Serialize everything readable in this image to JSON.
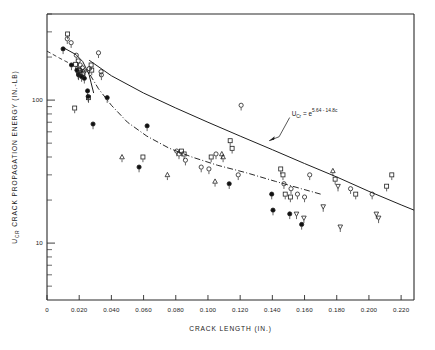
{
  "figure": {
    "background": "#ffffff",
    "ink": "#1f1f1f"
  },
  "chart_data": {
    "type": "scatter",
    "title": "",
    "xlabel": "CRACK  LENGTH (IN.)",
    "ylabel": "U    CRACK  PROPAGATION  ENERGY  (IN.-LB)",
    "ylabel_sub": "CR",
    "xlim": [
      0,
      0.228
    ],
    "ylim": [
      4.0,
      400
    ],
    "yscale": "log",
    "xscale": "linear",
    "grid": false,
    "legend": null,
    "xticks": [
      0,
      0.02,
      0.04,
      0.06,
      0.08,
      0.1,
      0.12,
      0.14,
      0.16,
      0.18,
      0.2,
      0.22
    ],
    "xticklabels": [
      "0",
      "0.020",
      "0.040",
      "0.060",
      "0.080",
      "0.100",
      "0.120",
      "0.140",
      "0.160",
      "0.180",
      "0.200",
      "0.220"
    ],
    "yticks": [
      100,
      10
    ],
    "yticklabels": [
      "100",
      "10"
    ],
    "yminorticks": [
      400,
      300,
      200,
      90,
      80,
      70,
      60,
      50,
      40,
      30,
      20,
      9,
      8,
      7,
      6,
      5
    ],
    "annotations": [
      {
        "name": "regression-equation",
        "text_main": "U",
        "text_sub": "Cr",
        "text_eq": " = e",
        "text_sup": "5.64 - 14.8c",
        "x": 0.152,
        "y": 78,
        "leader_to_x": 0.138,
        "leader_to_y": 52
      }
    ],
    "series": [
      {
        "name": "filled-circle",
        "marker": "filled-circle",
        "points": [
          {
            "x": 0.01,
            "y": 228
          },
          {
            "x": 0.0152,
            "y": 176
          },
          {
            "x": 0.0186,
            "y": 162
          },
          {
            "x": 0.0196,
            "y": 150
          },
          {
            "x": 0.0215,
            "y": 146
          },
          {
            "x": 0.0232,
            "y": 142
          },
          {
            "x": 0.0252,
            "y": 116
          },
          {
            "x": 0.0256,
            "y": 106
          },
          {
            "x": 0.0374,
            "y": 104
          },
          {
            "x": 0.0286,
            "y": 68
          },
          {
            "x": 0.0572,
            "y": 34
          },
          {
            "x": 0.0622,
            "y": 66
          },
          {
            "x": 0.1132,
            "y": 26
          },
          {
            "x": 0.1396,
            "y": 22
          },
          {
            "x": 0.1404,
            "y": 17
          },
          {
            "x": 0.1508,
            "y": 16
          },
          {
            "x": 0.1582,
            "y": 13.5
          }
        ]
      },
      {
        "name": "open-circle",
        "marker": "open-circle",
        "points": [
          {
            "x": 0.0126,
            "y": 268
          },
          {
            "x": 0.015,
            "y": 252
          },
          {
            "x": 0.0182,
            "y": 206
          },
          {
            "x": 0.0194,
            "y": 188
          },
          {
            "x": 0.0206,
            "y": 176
          },
          {
            "x": 0.022,
            "y": 168
          },
          {
            "x": 0.0232,
            "y": 160
          },
          {
            "x": 0.0262,
            "y": 166
          },
          {
            "x": 0.032,
            "y": 214
          },
          {
            "x": 0.0336,
            "y": 158
          },
          {
            "x": 0.0338,
            "y": 150
          },
          {
            "x": 0.1206,
            "y": 92
          },
          {
            "x": 0.0806,
            "y": 44
          },
          {
            "x": 0.082,
            "y": 42
          },
          {
            "x": 0.086,
            "y": 38
          },
          {
            "x": 0.0958,
            "y": 34
          },
          {
            "x": 0.1006,
            "y": 33
          },
          {
            "x": 0.105,
            "y": 42
          },
          {
            "x": 0.1188,
            "y": 30
          },
          {
            "x": 0.1472,
            "y": 26
          },
          {
            "x": 0.1516,
            "y": 24
          },
          {
            "x": 0.1556,
            "y": 22
          },
          {
            "x": 0.16,
            "y": 21
          },
          {
            "x": 0.1632,
            "y": 30
          },
          {
            "x": 0.1886,
            "y": 24
          },
          {
            "x": 0.202,
            "y": 22
          }
        ]
      },
      {
        "name": "open-square",
        "marker": "open-square",
        "points": [
          {
            "x": 0.0128,
            "y": 290
          },
          {
            "x": 0.0178,
            "y": 178
          },
          {
            "x": 0.0202,
            "y": 162
          },
          {
            "x": 0.0224,
            "y": 154
          },
          {
            "x": 0.0274,
            "y": 176
          },
          {
            "x": 0.0278,
            "y": 162
          },
          {
            "x": 0.0258,
            "y": 104
          },
          {
            "x": 0.0172,
            "y": 88
          },
          {
            "x": 0.0596,
            "y": 40
          },
          {
            "x": 0.0836,
            "y": 44
          },
          {
            "x": 0.0852,
            "y": 42
          },
          {
            "x": 0.102,
            "y": 40
          },
          {
            "x": 0.1138,
            "y": 52
          },
          {
            "x": 0.115,
            "y": 46
          },
          {
            "x": 0.1452,
            "y": 33
          },
          {
            "x": 0.1466,
            "y": 30
          },
          {
            "x": 0.148,
            "y": 22
          },
          {
            "x": 0.1512,
            "y": 21
          },
          {
            "x": 0.179,
            "y": 28
          },
          {
            "x": 0.1918,
            "y": 22
          },
          {
            "x": 0.211,
            "y": 25
          },
          {
            "x": 0.2142,
            "y": 30
          }
        ]
      },
      {
        "name": "open-triangle-up",
        "marker": "triangle-up",
        "points": [
          {
            "x": 0.0206,
            "y": 156
          },
          {
            "x": 0.0466,
            "y": 40
          },
          {
            "x": 0.0748,
            "y": 30
          },
          {
            "x": 0.1044,
            "y": 27
          },
          {
            "x": 0.1086,
            "y": 42
          },
          {
            "x": 0.1094,
            "y": 40
          },
          {
            "x": 0.1776,
            "y": 32
          }
        ]
      },
      {
        "name": "open-triangle-down",
        "marker": "triangle-down",
        "points": [
          {
            "x": 0.0194,
            "y": 152
          },
          {
            "x": 0.155,
            "y": 16
          },
          {
            "x": 0.1596,
            "y": 15
          },
          {
            "x": 0.1716,
            "y": 18
          },
          {
            "x": 0.1808,
            "y": 25
          },
          {
            "x": 0.1822,
            "y": 13
          },
          {
            "x": 0.2046,
            "y": 16
          },
          {
            "x": 0.206,
            "y": 15
          }
        ]
      }
    ],
    "curves": [
      {
        "name": "upper-solid-regression",
        "style": "solid",
        "points": [
          {
            "x": 0.0262,
            "y": 190
          },
          {
            "x": 0.04,
            "y": 148
          },
          {
            "x": 0.06,
            "y": 112
          },
          {
            "x": 0.08,
            "y": 88
          },
          {
            "x": 0.1,
            "y": 70
          },
          {
            "x": 0.12,
            "y": 56
          },
          {
            "x": 0.14,
            "y": 45
          },
          {
            "x": 0.16,
            "y": 36
          },
          {
            "x": 0.18,
            "y": 29
          },
          {
            "x": 0.2,
            "y": 23
          },
          {
            "x": 0.22,
            "y": 18.5
          },
          {
            "x": 0.228,
            "y": 17
          }
        ]
      },
      {
        "name": "upper-left-dashed",
        "style": "dashed",
        "points": [
          {
            "x": 0.0,
            "y": 220
          },
          {
            "x": 0.008,
            "y": 196
          },
          {
            "x": 0.016,
            "y": 176
          },
          {
            "x": 0.024,
            "y": 160
          },
          {
            "x": 0.0268,
            "y": 154
          }
        ]
      },
      {
        "name": "knee-solid-branch",
        "style": "solid",
        "points": [
          {
            "x": 0.011,
            "y": 230
          },
          {
            "x": 0.018,
            "y": 208
          },
          {
            "x": 0.0222,
            "y": 186
          },
          {
            "x": 0.0244,
            "y": 166
          },
          {
            "x": 0.0262,
            "y": 150
          },
          {
            "x": 0.0274,
            "y": 132
          },
          {
            "x": 0.029,
            "y": 112
          }
        ]
      },
      {
        "name": "lower-dashdot-curve",
        "style": "dashdot",
        "points": [
          {
            "x": 0.0268,
            "y": 150
          },
          {
            "x": 0.032,
            "y": 120
          },
          {
            "x": 0.04,
            "y": 92
          },
          {
            "x": 0.05,
            "y": 70
          },
          {
            "x": 0.062,
            "y": 56
          },
          {
            "x": 0.076,
            "y": 46
          },
          {
            "x": 0.09,
            "y": 40
          },
          {
            "x": 0.106,
            "y": 35
          },
          {
            "x": 0.124,
            "y": 31
          },
          {
            "x": 0.142,
            "y": 27
          },
          {
            "x": 0.158,
            "y": 24
          },
          {
            "x": 0.17,
            "y": 22
          }
        ]
      }
    ]
  }
}
